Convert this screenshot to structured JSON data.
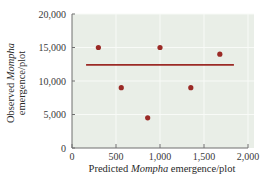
{
  "chart_data": {
    "type": "scatter",
    "title": "",
    "xlabel": "Predicted Mompha emergence/plot",
    "xlabel_parts": [
      {
        "text": "Predicted ",
        "italic": false
      },
      {
        "text": "Mompha",
        "italic": true
      },
      {
        "text": " emergence/plot",
        "italic": false
      }
    ],
    "ylabel": "Observed Mompha emergence/plot",
    "ylabel_lines": [
      [
        {
          "text": "Observed ",
          "italic": false
        },
        {
          "text": "Mompha",
          "italic": true
        }
      ],
      [
        {
          "text": "emergence/plot",
          "italic": false
        }
      ]
    ],
    "xlim": [
      0,
      2000
    ],
    "ylim": [
      0,
      20000
    ],
    "x_ticks": [
      0,
      500,
      1000,
      1500,
      2000
    ],
    "x_tick_labels": [
      "0",
      "500",
      "1,000",
      "1,500",
      "2,000"
    ],
    "y_ticks": [
      0,
      5000,
      10000,
      15000,
      20000
    ],
    "y_tick_labels": [
      "0",
      "5,000",
      "10,000",
      "15,000",
      "20,000"
    ],
    "grid": true,
    "legend": null,
    "series": [
      {
        "name": "Observed",
        "type": "scatter",
        "color": "#9b2a26",
        "points": [
          {
            "x": 300,
            "y": 15000
          },
          {
            "x": 560,
            "y": 9000
          },
          {
            "x": 860,
            "y": 4500
          },
          {
            "x": 1000,
            "y": 15000
          },
          {
            "x": 1350,
            "y": 9000
          },
          {
            "x": 1680,
            "y": 14000
          }
        ]
      },
      {
        "name": "Mean observed",
        "type": "line",
        "color": "#9b2a26",
        "points": [
          {
            "x": 160,
            "y": 12400
          },
          {
            "x": 1840,
            "y": 12400
          }
        ]
      }
    ]
  },
  "colors": {
    "plot_background": "#e9eee7",
    "grid": "#f8faf7",
    "axis": "#6e6e6e",
    "data": "#9b2a26"
  }
}
